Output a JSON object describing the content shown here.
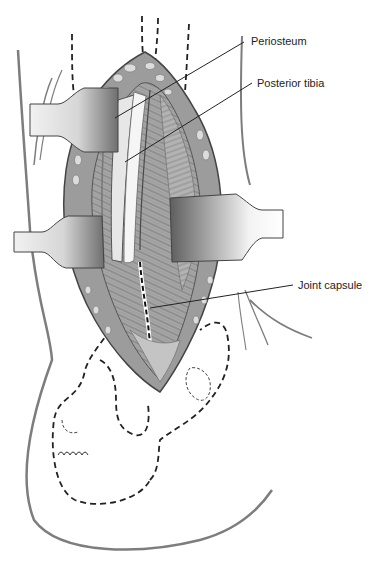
{
  "figure": {
    "labels": [
      {
        "id": "periosteum",
        "text": "Periosteum",
        "x": 250,
        "y": 34,
        "leader": [
          [
            244,
            42
          ],
          [
            115,
            120
          ]
        ]
      },
      {
        "id": "posterior-tibia",
        "text": "Posterior tibia",
        "x": 256,
        "y": 76,
        "leader": [
          [
            252,
            84
          ],
          [
            125,
            162
          ]
        ]
      },
      {
        "id": "joint-capsule",
        "text": "Joint capsule",
        "x": 298,
        "y": 279,
        "leader": [
          [
            293,
            285
          ],
          [
            150,
            308
          ]
        ]
      }
    ],
    "colors": {
      "outline": "#555555",
      "tissue_dark": "#6e6e6e",
      "tissue_mid": "#9a9a9a",
      "tissue_light": "#cfcfcf",
      "retractor_light": "#eeeeee",
      "retractor_dark": "#7a7a7a",
      "skin_line": "#7d7d7d",
      "dashed": "#222222"
    }
  }
}
